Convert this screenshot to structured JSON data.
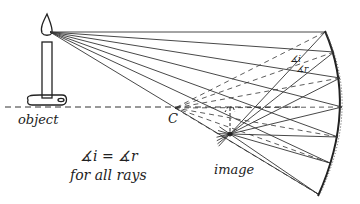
{
  "diagram": {
    "labels": {
      "object": "object",
      "center": "C",
      "image": "image",
      "angle_i": "∡i",
      "angle_r": "∡r",
      "law_line1": "∡i = ∡r",
      "law_line2": "for all rays"
    },
    "colors": {
      "ink": "#222222",
      "background": "#ffffff"
    },
    "elements": [
      "candle-object",
      "incident-rays",
      "reflected-rays",
      "normals",
      "concave-mirror",
      "principal-axis",
      "center-of-curvature",
      "image"
    ]
  }
}
